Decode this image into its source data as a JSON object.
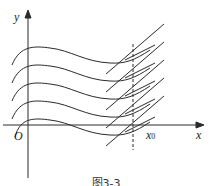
{
  "figure": {
    "axis_x_label": "x",
    "axis_y_label": "y",
    "origin_label": "O",
    "point_label": "x",
    "point_subscript": "0",
    "caption": "图3-3",
    "curve_count": 5
  }
}
